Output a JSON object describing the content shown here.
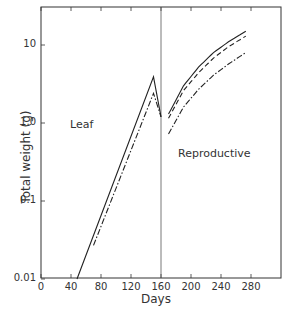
{
  "chart_data": {
    "type": "line",
    "title": "",
    "xlabel": "Days",
    "ylabel": "Total weight (g)",
    "xscale": "linear",
    "yscale": "log",
    "xlim": [
      0,
      320
    ],
    "ylim": [
      0.01,
      40
    ],
    "x_ticks": [
      "0",
      "40",
      "80",
      "120",
      "160",
      "200",
      "240",
      "280"
    ],
    "y_ticks": [
      "0.01",
      "0.1",
      "1.0",
      "10"
    ],
    "grid": false,
    "legend": null,
    "vertical_line_x": 160,
    "annotations": [
      {
        "text": "Leaf",
        "x": 50,
        "y": 0.9
      },
      {
        "text": "Reproductive",
        "x": 210,
        "y": 0.35
      }
    ],
    "series": [
      {
        "name": "Leaf (solid)",
        "style": "solid",
        "x": [
          48,
          150,
          160
        ],
        "y": [
          0.01,
          3.9,
          1.2
        ]
      },
      {
        "name": "Leaf (dash-dot)",
        "style": "dashdot",
        "x": [
          70,
          150,
          160
        ],
        "y": [
          0.027,
          2.4,
          1.2
        ]
      },
      {
        "name": "Reproductive (solid)",
        "style": "solid",
        "x": [
          170,
          190,
          210,
          230,
          250,
          273
        ],
        "y": [
          1.3,
          3.0,
          5.2,
          8.0,
          11.0,
          15.0
        ]
      },
      {
        "name": "Reproductive (dashed)",
        "style": "dashed",
        "x": [
          170,
          190,
          210,
          230,
          250,
          273
        ],
        "y": [
          1.15,
          2.6,
          4.4,
          6.8,
          9.5,
          13.0
        ]
      },
      {
        "name": "Reproductive (dash-dot)",
        "style": "dashdot",
        "x": [
          170,
          190,
          210,
          230,
          250,
          273
        ],
        "y": [
          0.72,
          1.6,
          2.7,
          4.1,
          5.7,
          8.0
        ]
      }
    ]
  },
  "labels": {
    "x_title": "Days",
    "y_title": "Total weight (g)",
    "leaf": "Leaf",
    "reproductive": "Reproductive"
  }
}
